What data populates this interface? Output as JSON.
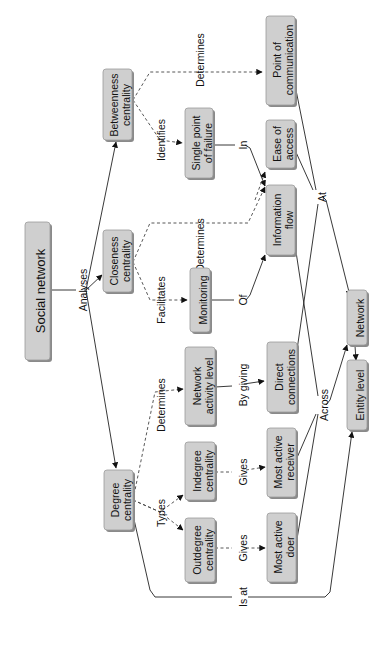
{
  "diagram": {
    "title": "Social network",
    "orientation": "rotated -90 degrees",
    "nodes": {
      "social_network": {
        "lines": [
          "Social network"
        ]
      },
      "betweenness": {
        "lines": [
          "Betweenness",
          "centrality"
        ]
      },
      "closeness": {
        "lines": [
          "Closeness",
          "centrality"
        ]
      },
      "degree": {
        "lines": [
          "Degree",
          "centrality"
        ]
      },
      "single_point": {
        "lines": [
          "Single point",
          "of failure"
        ]
      },
      "monitoring": {
        "lines": [
          "Monitoring"
        ]
      },
      "network_activity": {
        "lines": [
          "Network",
          "activity level"
        ]
      },
      "indegree": {
        "lines": [
          "Indegree",
          "centrality"
        ]
      },
      "outdegree": {
        "lines": [
          "Outdegree",
          "centrality"
        ]
      },
      "point_comm": {
        "lines": [
          "Point of",
          "communication"
        ]
      },
      "ease_access": {
        "lines": [
          "Ease of",
          "access"
        ]
      },
      "info_flow": {
        "lines": [
          "Information",
          "flow"
        ]
      },
      "direct_conn": {
        "lines": [
          "Direct",
          "connections"
        ]
      },
      "most_receiver": {
        "lines": [
          "Most active",
          "receiver"
        ]
      },
      "most_doer": {
        "lines": [
          "Most active",
          "doer"
        ]
      },
      "network": {
        "lines": [
          "Network"
        ]
      },
      "entity_level": {
        "lines": [
          "Entity level"
        ]
      }
    },
    "edge_labels": {
      "analyses": "Analyses",
      "identifies": "Identifies",
      "determines_pc": "Determines",
      "determines_if": "Determines",
      "facilitates": "Facilitates",
      "determines_nal": "Determines",
      "types": "Types",
      "in": "In",
      "of": "Of",
      "by_giving": "By giving",
      "gives_in": "Gives",
      "gives_out": "Gives",
      "at": "At",
      "across": "Across",
      "is_at": "Is at"
    }
  }
}
